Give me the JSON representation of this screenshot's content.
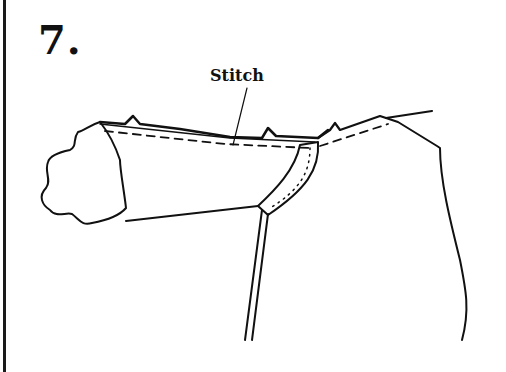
{
  "figure": {
    "step_number": "7.",
    "callout_label": "Stitch",
    "colors": {
      "line": "#111111",
      "background": "#ffffff"
    }
  }
}
